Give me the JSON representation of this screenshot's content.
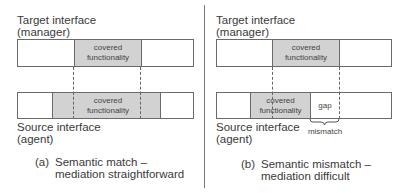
{
  "panels": [
    {
      "id": "a",
      "target_label_line1": "Target interface",
      "target_label_line2": "(manager)",
      "target_covered_line1": "covered",
      "target_covered_line2": "functionality",
      "source_covered_line1": "covered",
      "source_covered_line2": "functionality",
      "source_label_line1": "Source interface",
      "source_label_line2": "(agent)",
      "caption_prefix": "(a)",
      "caption_line1": "Semantic match –",
      "caption_line2": "mediation straightforward"
    },
    {
      "id": "b",
      "target_label_line1": "Target interface",
      "target_label_line2": "(manager)",
      "target_covered_line1": "covered",
      "target_covered_line2": "functionality",
      "source_covered_line1": "covered",
      "source_covered_line2": "functionality",
      "gap_label": "gap",
      "mismatch_label": "mismatch",
      "source_label_line1": "Source interface",
      "source_label_line2": "(agent)",
      "caption_prefix": "(b)",
      "caption_line1": "Semantic mismatch –",
      "caption_line2": "mediation difficult"
    }
  ]
}
